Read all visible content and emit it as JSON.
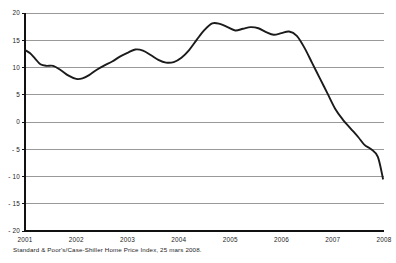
{
  "caption": "Standard & Poor's/Case-Shiller Home Price Index, 25 mars 2008.",
  "axis": {
    "y_ticks": [
      "20",
      "15",
      "10",
      "5",
      "0",
      "- 5",
      "- 10",
      "- 15",
      "- 20"
    ],
    "x_ticks": [
      "2001",
      "2002",
      "2003",
      "2004",
      "2005",
      "2006",
      "2007",
      "2008"
    ]
  },
  "colors": {
    "line": "#1b1b1b",
    "grid": "#6d6d6d",
    "axis": "#111111",
    "background": "#ffffff"
  },
  "chart_data": {
    "type": "line",
    "title": "",
    "subtitle": "",
    "xlabel": "",
    "ylabel": "",
    "xlim": [
      2001,
      2008
    ],
    "ylim": [
      -20,
      20
    ],
    "grid": true,
    "legend": false,
    "y_tick_values": [
      20,
      15,
      10,
      5,
      0,
      -5,
      -10,
      -15,
      -20
    ],
    "x_tick_values": [
      2001,
      2002,
      2003,
      2004,
      2005,
      2006,
      2007,
      2008
    ],
    "annotation": "Standard & Poor's/Case-Shiller Home Price Index, 25 mars 2008.",
    "series": [
      {
        "name": "Case-Shiller Home Price Index, annual % change",
        "x": [
          2001.0,
          2001.1,
          2001.2,
          2001.3,
          2001.42,
          2001.55,
          2001.7,
          2001.85,
          2002.0,
          2002.12,
          2002.25,
          2002.4,
          2002.55,
          2002.7,
          2002.85,
          2003.0,
          2003.15,
          2003.3,
          2003.45,
          2003.6,
          2003.75,
          2003.9,
          2004.05,
          2004.2,
          2004.35,
          2004.5,
          2004.65,
          2004.8,
          2004.95,
          2005.1,
          2005.25,
          2005.4,
          2005.55,
          2005.7,
          2005.85,
          2006.0,
          2006.15,
          2006.3,
          2006.45,
          2006.6,
          2006.75,
          2006.9,
          2007.05,
          2007.2,
          2007.35,
          2007.5,
          2007.62,
          2007.75,
          2007.88
        ],
        "y": [
          13.2,
          12.6,
          11.6,
          10.6,
          10.3,
          10.3,
          9.5,
          8.5,
          7.9,
          8.0,
          8.6,
          9.6,
          10.4,
          11.1,
          12.0,
          12.7,
          13.3,
          13.1,
          12.3,
          11.4,
          10.9,
          11.0,
          11.8,
          13.2,
          15.1,
          16.9,
          18.1,
          18.0,
          17.4,
          16.8,
          17.1,
          17.4,
          17.2,
          16.5,
          16.0,
          16.3,
          16.6,
          15.8,
          13.6,
          10.8,
          8.0,
          5.2,
          2.4,
          0.4,
          -1.2,
          -2.8,
          -4.2,
          -5.0,
          -6.4
        ],
        "y_end": -10.4
      }
    ]
  }
}
